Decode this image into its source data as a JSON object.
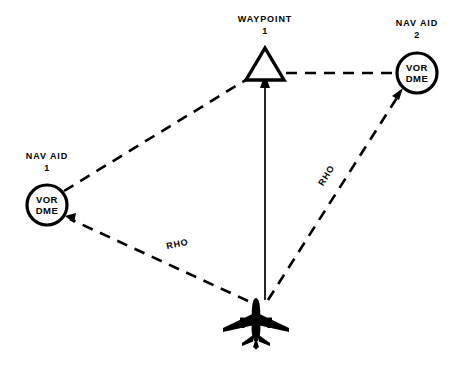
{
  "diagram": {
    "background_color": "#ffffff",
    "stroke_color": "#000000",
    "nodes": {
      "waypoint": {
        "label_line1": "WAYPOINT",
        "label_line2": "1",
        "shape": "triangle",
        "x": 265,
        "y": 68
      },
      "nav_aid_2": {
        "label_line1": "NAV AID",
        "label_line2": "2",
        "inner_line1": "VOR",
        "inner_line2": "DME",
        "shape": "circle",
        "x": 417,
        "y": 72,
        "radius": 20
      },
      "nav_aid_1": {
        "label_line1": "NAV AID",
        "label_line2": "1",
        "inner_line1": "VOR",
        "inner_line2": "DME",
        "shape": "circle",
        "x": 47,
        "y": 205,
        "radius": 20
      },
      "aircraft": {
        "shape": "aircraft-silhouette",
        "x": 256,
        "y": 322
      }
    },
    "edges": {
      "navaid1_to_waypoint": {
        "style": "dashed",
        "arrow": false,
        "label": ""
      },
      "waypoint_to_navaid2": {
        "style": "dashed",
        "arrow": false,
        "label": ""
      },
      "aircraft_to_waypoint": {
        "style": "solid",
        "arrow": true,
        "label": ""
      },
      "aircraft_to_navaid1": {
        "style": "dashed",
        "arrow": true,
        "label": "RHO"
      },
      "aircraft_to_navaid2": {
        "style": "dashed",
        "arrow": true,
        "label": "RHO"
      }
    }
  }
}
